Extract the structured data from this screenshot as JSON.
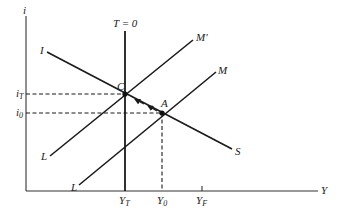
{
  "diagram": {
    "type": "IS-LM shift diagram",
    "axes": {
      "y_label": "i",
      "x_label": "Y"
    },
    "vertical_line_label": "T = 0",
    "curves": {
      "is_start": "I",
      "is_end": "S",
      "lm_prime_start": "L",
      "lm_prime_end": "M'",
      "lm_start": "L",
      "lm_end": "M"
    },
    "points": {
      "c": "C",
      "a": "A"
    },
    "y_ticks": {
      "i_t": {
        "base": "i",
        "sub": "T"
      },
      "i_0": {
        "base": "i",
        "sub": "0"
      }
    },
    "x_ticks": {
      "y_t": {
        "base": "Y",
        "sub": "T"
      },
      "y_0": {
        "base": "Y",
        "sub": "0"
      },
      "y_f": {
        "base": "Y",
        "sub": "F"
      }
    },
    "line_color": "#1a1a1a",
    "background": "#ffffff"
  }
}
